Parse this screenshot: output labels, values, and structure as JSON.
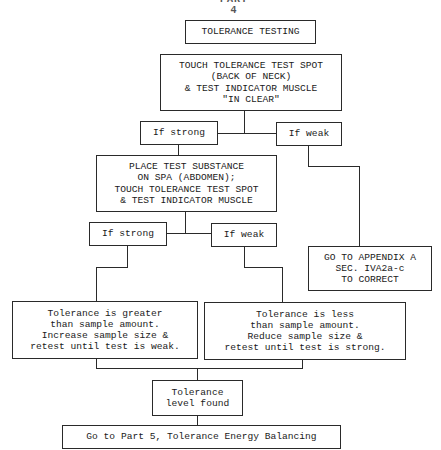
{
  "page": {
    "title": "PART 4"
  },
  "flowchart": {
    "title_box": "TOLERANCE TESTING",
    "step1": "TOUCH TOLERANCE TEST SPOT\n(BACK OF NECK)\n& TEST INDICATOR MUSCLE\n\"IN CLEAR\"",
    "branch1": {
      "strong": "If strong",
      "weak": "If weak"
    },
    "step2": "PLACE TEST SUBSTANCE\nON SPA (ABDOMEN);\nTOUCH TOLERANCE TEST SPOT\n& TEST INDICATOR MUSCLE",
    "appendix_box": "GO TO APPENDIX A\nSEC. IVA2a-c\nTO CORRECT",
    "branch2": {
      "strong": "If strong",
      "weak": "If weak"
    },
    "result_greater": "Tolerance is greater\nthan sample amount.\nIncrease sample size &\nretest until test is weak.",
    "result_less": "Tolerance is less\nthan sample amount.\nReduce sample size &\nretest until test is strong.",
    "level_found": "Tolerance\nlevel found",
    "next_step": "Go to Part 5, Tolerance Energy Balancing"
  },
  "colors": {
    "line": "#2a2a2a",
    "background": "#ffffff",
    "text": "#1a1a1a"
  }
}
